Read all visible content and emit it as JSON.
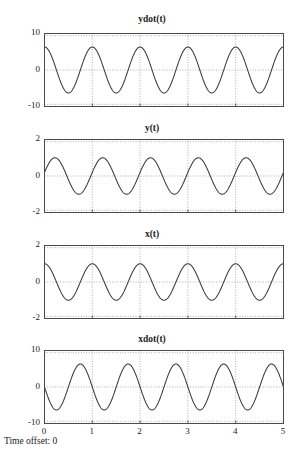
{
  "figure": {
    "caption": "Time offset: 0",
    "axis_color": "#4a4a4a",
    "curve_color": "#3a3a3a",
    "grid_color": "#9a9a9a",
    "background": "#ffffff"
  },
  "chart_data": [
    {
      "type": "line",
      "title": "ydot(t)",
      "xlabel": "",
      "ylabel": "",
      "xlim": [
        0,
        5
      ],
      "ylim": [
        -10,
        10
      ],
      "xticks": [
        0,
        1,
        2,
        3,
        4,
        5
      ],
      "xticklabels": [
        "",
        "",
        "",
        "",
        "",
        ""
      ],
      "yticks": [
        -10,
        0,
        10
      ],
      "yticklabels": [
        "-10",
        "0",
        "10"
      ],
      "grid": true,
      "series": [
        {
          "name": "ydot",
          "form": "amplitude*cos(2*pi*frequency*t + phase)",
          "amplitude": 6.3,
          "frequency": 1.0,
          "phase": 0.0,
          "offset": 0.0
        }
      ]
    },
    {
      "type": "line",
      "title": "y(t)",
      "xlabel": "",
      "ylabel": "",
      "xlim": [
        0,
        5
      ],
      "ylim": [
        -2,
        2
      ],
      "xticks": [
        0,
        1,
        2,
        3,
        4,
        5
      ],
      "xticklabels": [
        "",
        "",
        "",
        "",
        "",
        ""
      ],
      "yticks": [
        -2,
        0,
        2
      ],
      "yticklabels": [
        "-2",
        "0",
        "2"
      ],
      "grid": true,
      "series": [
        {
          "name": "y",
          "form": "amplitude*cos(2*pi*frequency*t + phase)",
          "amplitude": 1.0,
          "frequency": 1.0,
          "phase": -1.37,
          "offset": 0.0
        }
      ]
    },
    {
      "type": "line",
      "title": "x(t)",
      "xlabel": "",
      "ylabel": "",
      "xlim": [
        0,
        5
      ],
      "ylim": [
        -2,
        2
      ],
      "xticks": [
        0,
        1,
        2,
        3,
        4,
        5
      ],
      "xticklabels": [
        "",
        "",
        "",
        "",
        "",
        ""
      ],
      "yticks": [
        -2,
        0,
        2
      ],
      "yticklabels": [
        "-2",
        "0",
        "2"
      ],
      "grid": true,
      "series": [
        {
          "name": "x",
          "form": "amplitude*cos(2*pi*frequency*t + phase)",
          "amplitude": 1.0,
          "frequency": 1.0,
          "phase": 0.0,
          "offset": 0.0
        }
      ]
    },
    {
      "type": "line",
      "title": "xdot(t)",
      "xlabel": "",
      "ylabel": "",
      "xlim": [
        0,
        5
      ],
      "ylim": [
        -10,
        10
      ],
      "xticks": [
        0,
        1,
        2,
        3,
        4,
        5
      ],
      "xticklabels": [
        "0",
        "1",
        "2",
        "3",
        "4",
        "5"
      ],
      "yticks": [
        -10,
        0,
        10
      ],
      "yticklabels": [
        "-10",
        "0",
        "10"
      ],
      "grid": true,
      "series": [
        {
          "name": "xdot",
          "form": "amplitude*cos(2*pi*frequency*t + phase)",
          "amplitude": 6.3,
          "frequency": 1.0,
          "phase": 1.5708,
          "offset": 0.0
        }
      ]
    }
  ]
}
